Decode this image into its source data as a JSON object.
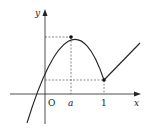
{
  "diagram": {
    "type": "function-graph",
    "axes": {
      "x_label": "x",
      "y_label": "y",
      "origin_label": "O"
    },
    "tick_labels": [
      {
        "text": "a",
        "italic": true
      },
      {
        "text": "1",
        "italic": false
      }
    ],
    "key_points": [
      {
        "name": "maximum",
        "x_label": "a"
      },
      {
        "name": "corner",
        "x_label": "1"
      }
    ],
    "pieces": [
      "parabola opening downward on x < 1, vertex at x = a",
      "increasing straight line for x ≥ 1"
    ],
    "colors": {
      "stroke": "#222222",
      "dashed": "#555555"
    }
  }
}
